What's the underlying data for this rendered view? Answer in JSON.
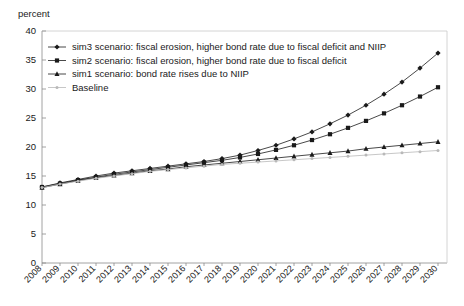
{
  "chart_data": {
    "type": "line",
    "title": "",
    "ylabel": "percent",
    "xlabel": "",
    "ylim": [
      0,
      40
    ],
    "ytick_step": 5,
    "yticks": [
      "0",
      "5",
      "10",
      "15",
      "20",
      "25",
      "30",
      "35",
      "40"
    ],
    "grid": false,
    "legend_position": "top-left",
    "categories": [
      "2008",
      "2009",
      "2010",
      "2011",
      "2012",
      "2013",
      "2014",
      "2015",
      "2016",
      "2017",
      "2018",
      "2019",
      "2020",
      "2021",
      "2022",
      "2023",
      "2024",
      "2025",
      "2026",
      "2027",
      "2028",
      "2029",
      "2030"
    ],
    "series": [
      {
        "name": "sim3 scenario: fiscal erosion, higher bond rate due to fiscal deficit and NIIP",
        "key": "sim3",
        "marker": "diamond",
        "color": "#1a1a1a",
        "values": [
          13.1,
          13.8,
          14.4,
          15.0,
          15.5,
          15.9,
          16.3,
          16.7,
          17.1,
          17.5,
          18.0,
          18.6,
          19.4,
          20.3,
          21.4,
          22.6,
          24.0,
          25.5,
          27.2,
          29.1,
          31.2,
          33.6,
          36.2
        ]
      },
      {
        "name": "sim2 scenario: fiscal erosion, higher bond rate due to fiscal deficit",
        "key": "sim2",
        "marker": "square",
        "color": "#1a1a1a",
        "values": [
          13.1,
          13.7,
          14.3,
          14.8,
          15.3,
          15.7,
          16.1,
          16.5,
          16.9,
          17.3,
          17.7,
          18.2,
          18.8,
          19.5,
          20.3,
          21.2,
          22.2,
          23.3,
          24.5,
          25.8,
          27.2,
          28.7,
          30.3
        ]
      },
      {
        "name": "sim1 scenario: bond rate rises due to NIIP",
        "key": "sim1",
        "marker": "triangle",
        "color": "#1a1a1a",
        "values": [
          13.0,
          13.6,
          14.2,
          14.7,
          15.1,
          15.5,
          15.9,
          16.2,
          16.6,
          16.9,
          17.2,
          17.5,
          17.8,
          18.1,
          18.4,
          18.7,
          19.0,
          19.3,
          19.7,
          20.0,
          20.3,
          20.6,
          20.9
        ]
      },
      {
        "name": "Baseline",
        "key": "baseline",
        "marker": "dot",
        "color": "#b9b9b9",
        "values": [
          13.0,
          13.6,
          14.1,
          14.6,
          15.0,
          15.4,
          15.8,
          16.1,
          16.4,
          16.7,
          17.0,
          17.2,
          17.4,
          17.6,
          17.8,
          18.0,
          18.2,
          18.4,
          18.6,
          18.8,
          19.0,
          19.2,
          19.4
        ]
      }
    ]
  }
}
